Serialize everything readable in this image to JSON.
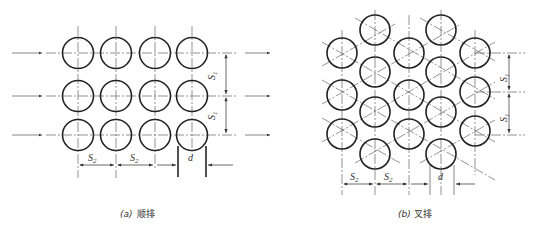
{
  "panels": [
    {
      "id": "a",
      "caption_label": "(a)",
      "caption_text": "顺排",
      "arrangement": "in-line",
      "rows": 3,
      "cols": 4,
      "labels": {
        "s1_top": "S1",
        "s1_bottom": "S1",
        "s2_left": "S2",
        "s2_mid": "S2",
        "d": "d"
      }
    },
    {
      "id": "b",
      "caption_label": "(b)",
      "caption_text": "叉排",
      "arrangement": "staggered",
      "columns": 5,
      "labels": {
        "s1_top": "S1",
        "s1_bottom": "S1",
        "s2_left": "S2",
        "s2_mid": "S2",
        "d": "d"
      }
    }
  ]
}
